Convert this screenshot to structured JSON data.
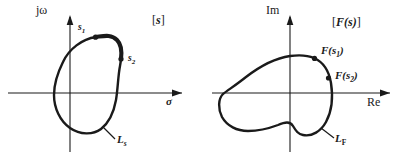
{
  "figure": {
    "caption_present": false,
    "background_color": "#ffffff",
    "ink_color": "#1a1a1a"
  },
  "panels": [
    {
      "id": "s-plane",
      "plane_label": "[s]",
      "plane_label_open": "[",
      "plane_label_body": "s",
      "plane_label_close": "]",
      "vertical_axis_label": "jω",
      "horizontal_axis_label": "σ",
      "contour_label": "L",
      "contour_label_sub": "s",
      "points": [
        {
          "name": "s1",
          "label": "s",
          "sub": "1"
        },
        {
          "name": "s2",
          "label": "s",
          "sub": "2"
        }
      ]
    },
    {
      "id": "fs-plane",
      "plane_label": "[F(s)]",
      "plane_label_open": "[",
      "plane_label_body": "F(s)",
      "plane_label_close": "]",
      "vertical_axis_label": "Im",
      "horizontal_axis_label": "Re",
      "contour_label": "L",
      "contour_label_sub": "F",
      "points": [
        {
          "name": "F(s1)",
          "label": "F(s",
          "sub": "1",
          "label_end": ")"
        },
        {
          "name": "F(s2)",
          "label": "F(s",
          "sub": "2",
          "label_end": ")"
        }
      ]
    }
  ]
}
